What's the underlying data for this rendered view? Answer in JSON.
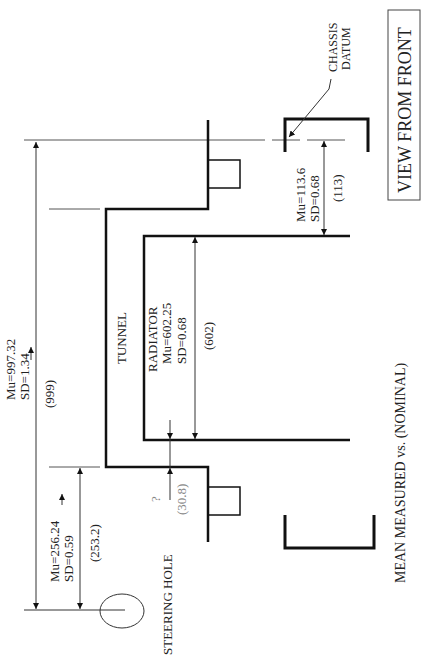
{
  "title": "VIEW FROM FRONT",
  "caption": "MEAN MEASURED vs. (NOMINAL)",
  "colors": {
    "line": "#111111",
    "thin_line": "#333333",
    "text": "#222222",
    "faint_text": "#999999",
    "background": "#ffffff"
  },
  "labels": {
    "tunnel": "TUNNEL",
    "radiator": "RADIATOR",
    "steering_hole": "STEERING HOLE",
    "chassis_datum_line1": "CHASSIS",
    "chassis_datum_line2": "DATUM"
  },
  "dimensions": {
    "overall": {
      "mean": "Mu=997.32",
      "sd": "SD=1.34",
      "nominal": "(999)"
    },
    "steering_to_tunnel": {
      "mean": "Mu=256.24",
      "sd": "SD=0.59",
      "nominal": "(253.2)"
    },
    "radiator": {
      "mean": "Mu=602.25",
      "sd": "SD=0.68",
      "nominal": "(602)"
    },
    "datum_to_radiator": {
      "mean": "Mu=113.6",
      "sd": "SD=0.68",
      "nominal": "(113)"
    },
    "tunnel_to_radiator": {
      "mean": "?",
      "nominal": "(30.8)"
    }
  }
}
